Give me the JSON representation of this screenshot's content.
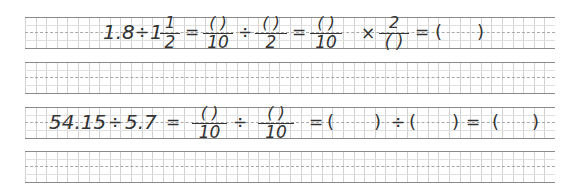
{
  "worksheet": {
    "rows": [
      {
        "id": "problem-1",
        "expression": "1.8 ÷ 1 1/2 = ( )/10 ÷ ( )/2 = ( )/10 × 2/( ) = ( )",
        "tokens": {
          "t1": "1.8",
          "op1": "÷",
          "whole": "1",
          "mixed_num": "1",
          "mixed_den": "2",
          "eq1": "=",
          "f1_num": "(    )",
          "f1_den": "10",
          "op2": "÷",
          "f2_num": "(    )",
          "f2_den": "2",
          "eq2": "=",
          "f3_num": "(    )",
          "f3_den": "10",
          "op3": "×",
          "f4_num": "2",
          "f4_den": "(    )",
          "eq3": "=",
          "ans_open": "(",
          "ans_close": ")"
        }
      },
      {
        "id": "problem-2",
        "expression": "54.15 ÷ 5.7 = ( )/10 ÷ ( )/10 = ( ) ÷ ( ) = ( )",
        "tokens": {
          "t1": "54.15",
          "op1": "÷",
          "t2": "5.7",
          "eq1": "=",
          "f1_num": "(    )",
          "f1_den": "10",
          "op2": "÷",
          "f2_num": "(    )",
          "f2_den": "10",
          "eq2": "=",
          "b1_open": "(",
          "b1_close": ")",
          "op3": "÷",
          "b2_open": "(",
          "b2_close": ")",
          "eq3": "=",
          "ans_open": "(",
          "ans_close": ")"
        }
      }
    ],
    "blank_rows": 2
  }
}
